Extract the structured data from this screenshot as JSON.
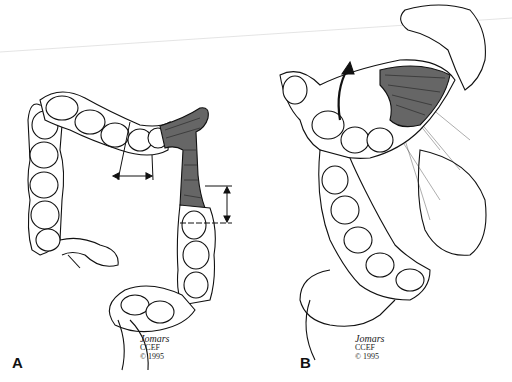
{
  "figure": {
    "type": "medical illustration",
    "panels": [
      {
        "label": "A",
        "description": "Colon with segmented haustra; darkened shaded segment at splenic flexure / descending colon with measurement arrows",
        "annotations": [
          "horizontal double-headed measurement arrow on transverse colon",
          "vertical double-headed measurement arrow on descending colon",
          "cut lines marking resection margins"
        ],
        "signature": {
          "name": "Jomars",
          "org": "CCEF",
          "copyright": "© 1995"
        }
      },
      {
        "label": "B",
        "description": "Colon mobilized with curved arrow indicating rotation; shaded segment retracted beneath stomach with omentum",
        "annotations": [
          "curved upward arrow indicating mobilization direction"
        ],
        "signature": {
          "name": "Jomars",
          "org": "CCEF",
          "copyright": "© 1995"
        }
      }
    ]
  },
  "labels": {
    "a": "A",
    "b": "B"
  },
  "signature": {
    "name": "Jomars",
    "org": "CCEF",
    "copyright": "© 1995"
  },
  "colors": {
    "ink": "#111111",
    "shade": "#555555",
    "background": "#ffffff"
  }
}
